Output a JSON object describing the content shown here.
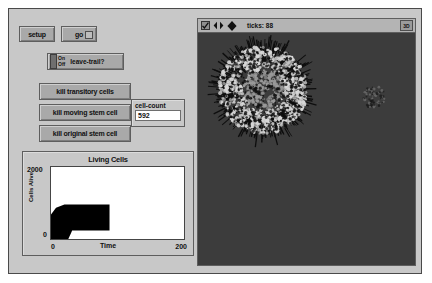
{
  "window": {
    "background": "#c8c8c8",
    "border_color": "#4a4a4a"
  },
  "controls": {
    "setup_label": "setup",
    "go_label": "go",
    "leave_trail": {
      "on_label": "On",
      "off_label": "Off",
      "label": "leave-trail?",
      "state": "Off"
    },
    "kill_buttons": [
      {
        "label": "kill transitory cells"
      },
      {
        "label": "kill moving stem cell"
      },
      {
        "label": "kill original stem cell"
      }
    ],
    "monitor": {
      "label": "cell-count",
      "value": "592"
    }
  },
  "view": {
    "ticks_label": "ticks: 88",
    "threed_label": "3D",
    "icons": [
      "checkbox-icon",
      "horizontal-arrows-icon",
      "four-way-move-icon"
    ],
    "background": "#3c3c3c",
    "colony": {
      "center_x": 65,
      "center_y": 57,
      "radius": 44,
      "cell_color": "#d8d8d8",
      "trail_color": "#0e0e0e"
    },
    "satellite": {
      "center_x": 176,
      "center_y": 64,
      "radius": 11
    }
  },
  "chart_data": {
    "type": "line",
    "title": "Living Cells",
    "xlabel": "Time",
    "ylabel": "Cells Alive",
    "xlim": [
      0,
      200
    ],
    "ylim": [
      0,
      2000
    ],
    "xtick_min": "0",
    "xtick_max": "200",
    "ytick_min": "0",
    "ytick_max": "2000",
    "grid": false,
    "series": [
      {
        "name": "Cells Alive",
        "color": "#000000",
        "x": [
          0,
          4,
          8,
          12,
          16,
          20,
          24,
          88
        ],
        "y": [
          0,
          40,
          140,
          300,
          470,
          570,
          600,
          600
        ]
      }
    ]
  }
}
